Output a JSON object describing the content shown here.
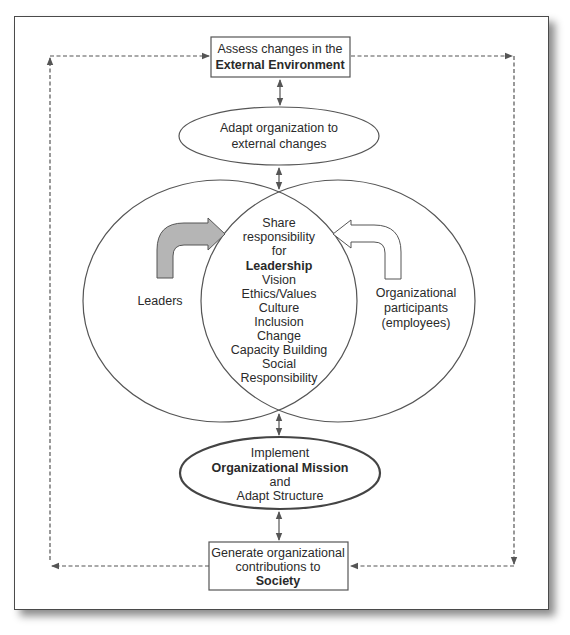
{
  "diagram": {
    "top_box": {
      "line1": "Assess changes in the",
      "line2": "External Environment"
    },
    "adapt_ellipse": {
      "line1": "Adapt organization to",
      "line2": "external changes"
    },
    "left_circle": {
      "label": "Leaders",
      "arrow_color": "#b5b5b5"
    },
    "right_circle": {
      "line1": "Organizational",
      "line2": "participants",
      "line3": "(employees)",
      "arrow_color": "#ffffff"
    },
    "center": {
      "lines": [
        "Share",
        "responsibility",
        "for"
      ],
      "bold_line": "Leadership",
      "items": [
        "Vision",
        "Ethics/Values",
        "Culture",
        "Inclusion",
        "Change",
        "Capacity Building",
        "Social",
        "Responsibility"
      ]
    },
    "mission_ellipse": {
      "line1": "Implement",
      "line2": "Organizational Mission",
      "line3": "and",
      "line4": "Adapt Structure"
    },
    "bottom_box": {
      "line1": "Generate organizational",
      "line2": "contributions to",
      "line3": "Society"
    }
  }
}
